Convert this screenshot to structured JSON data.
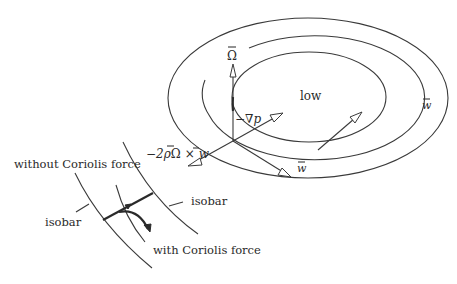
{
  "figure": {
    "type": "physics diagram",
    "labels": {
      "center": "low",
      "omega": "Ω⃗",
      "omega_plain": "Ω",
      "grad_p": "−∇p",
      "wind_bottom": "w⃗",
      "wind_right": "w⃗",
      "wind_symbol": "w",
      "coriolis": "−2ρΩ⃗ × w⃗",
      "coriolis_prefix": "−2ρ",
      "coriolis_times": "×",
      "without": "without Coriolis force",
      "with": "with Coriolis force",
      "isobar_left": "isobar",
      "isobar_right": "isobar"
    },
    "elements": {
      "isobar_ellipses": 3,
      "vectors": [
        "Ω (up)",
        "−∇p (toward low)",
        "w (tangent, bottom)",
        "w (tangent, right)",
        "−2ρΩ×w (Coriolis)"
      ],
      "inset": "wind path between two isobars, with and without Coriolis deflection"
    }
  }
}
